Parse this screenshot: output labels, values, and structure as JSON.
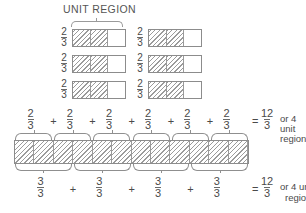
{
  "diagram": {
    "title": "UNIT REGION",
    "top_grid": {
      "rows": 3,
      "cols": 2,
      "cell_label": {
        "num": "2",
        "den": "3"
      },
      "rect_total_cells": 3,
      "rect_hatched_cells": 2
    },
    "middle_row": {
      "terms": [
        {
          "num": "2",
          "den": "3"
        },
        {
          "num": "2",
          "den": "3"
        },
        {
          "num": "2",
          "den": "3"
        },
        {
          "num": "2",
          "den": "3"
        },
        {
          "num": "2",
          "den": "3"
        },
        {
          "num": "2",
          "den": "3"
        }
      ],
      "plus": "+",
      "equals": "=",
      "result": {
        "num": "12",
        "den": "3"
      },
      "or_text": "or 4",
      "unit_text": "unit",
      "regions_text": "regions"
    },
    "long_bar": {
      "total_cells": 12,
      "hatched_cells": 12,
      "upper_braces": 6,
      "lower_braces": 4
    },
    "bottom_row": {
      "terms": [
        {
          "num": "3",
          "den": "3"
        },
        {
          "num": "3",
          "den": "3"
        },
        {
          "num": "3",
          "den": "3"
        },
        {
          "num": "3",
          "den": "3"
        }
      ],
      "plus": "+",
      "equals": "=",
      "result": {
        "num": "12",
        "den": "3"
      },
      "or_text": "or 4 unit",
      "regions_text": "regions"
    }
  },
  "colors": {
    "line": "#8c8c8c",
    "hatch": "#9b9b9b",
    "text": "#4a4a4a",
    "background": "#ffffff"
  }
}
